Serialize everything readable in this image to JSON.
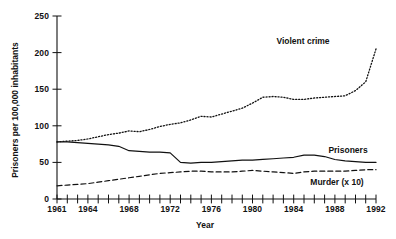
{
  "chart_data": {
    "type": "line",
    "title": "",
    "xlabel": "Year",
    "ylabel": "Prisoners per 100,000 inhabitants",
    "xlim": [
      1961,
      1992
    ],
    "ylim": [
      0,
      250
    ],
    "grid": false,
    "legend_position": "inline-right",
    "y_ticks": [
      "0",
      "50",
      "100",
      "150",
      "200",
      "250"
    ],
    "y_tick_values": [
      0,
      50,
      100,
      150,
      200,
      250
    ],
    "x_ticks": [
      "1961",
      "1964",
      "1968",
      "1972",
      "1976",
      "1980",
      "1984",
      "1988",
      "1992"
    ],
    "x_tick_values": [
      1961,
      1964,
      1968,
      1972,
      1976,
      1980,
      1984,
      1988,
      1992
    ],
    "x_minor_tick_interval": 1,
    "x": [
      1961,
      1962,
      1963,
      1964,
      1965,
      1966,
      1967,
      1968,
      1969,
      1970,
      1971,
      1972,
      1973,
      1974,
      1975,
      1976,
      1977,
      1978,
      1979,
      1980,
      1981,
      1982,
      1983,
      1984,
      1985,
      1986,
      1987,
      1988,
      1989,
      1990,
      1991,
      1992
    ],
    "series": [
      {
        "name": "Violent crime",
        "style": "dotted",
        "label": "Violent crime",
        "values": [
          78,
          79,
          80,
          82,
          85,
          88,
          90,
          93,
          92,
          95,
          99,
          102,
          104,
          108,
          113,
          112,
          116,
          120,
          124,
          131,
          139,
          140,
          139,
          136,
          136,
          138,
          139,
          140,
          141,
          148,
          160,
          205
        ]
      },
      {
        "name": "Prisoners",
        "style": "solid",
        "label": "Prisoners",
        "values": [
          78,
          78,
          77,
          76,
          75,
          74,
          72,
          66,
          65,
          64,
          64,
          63,
          50,
          49,
          50,
          50,
          51,
          52,
          53,
          53,
          54,
          55,
          56,
          57,
          60,
          60,
          58,
          54,
          52,
          51,
          50,
          50
        ]
      },
      {
        "name": "Murder (x 10)",
        "style": "dashed",
        "label": "Murder (x 10)",
        "values": [
          18,
          19,
          20,
          21,
          23,
          25,
          27,
          29,
          31,
          33,
          35,
          36,
          37,
          38,
          38,
          37,
          37,
          37,
          38,
          39,
          38,
          37,
          36,
          35,
          37,
          38,
          38,
          38,
          38,
          39,
          40,
          40
        ]
      }
    ],
    "annotations": [
      {
        "text": "Violent crime",
        "series": "Violent crime"
      },
      {
        "text": "Prisoners",
        "series": "Prisoners"
      },
      {
        "text": "Murder (x 10)",
        "series": "Murder (x 10)"
      }
    ]
  }
}
